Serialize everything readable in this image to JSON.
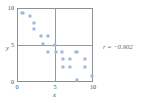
{
  "chart_data": {
    "type": "scatter",
    "title": "",
    "subtitle": "",
    "xlabel": "x",
    "ylabel": "y",
    "xlim": [
      0,
      10
    ],
    "ylim": [
      0,
      10
    ],
    "xticks": [
      0,
      5,
      10
    ],
    "yticks": [
      0,
      5,
      10
    ],
    "xtick_labels": [
      "0",
      "5",
      "10"
    ],
    "ytick_labels": [
      "0",
      "5",
      "10"
    ],
    "grid": true,
    "gridlines": {
      "vertical": [
        5
      ],
      "horizontal": [
        5
      ]
    },
    "legend": null,
    "annotations": [
      {
        "text": "r = −0.902",
        "x": 11.8,
        "y": 5.0,
        "meaning": "correlation-coefficient"
      }
    ],
    "marker": {
      "shape": "square",
      "color": "#9fb6dd",
      "size": 3
    },
    "points": [
      {
        "x": 0.6,
        "y": 9.5
      },
      {
        "x": 1.6,
        "y": 9.0
      },
      {
        "x": 2.2,
        "y": 8.1
      },
      {
        "x": 2.2,
        "y": 7.2
      },
      {
        "x": 3.1,
        "y": 6.2
      },
      {
        "x": 4.1,
        "y": 6.2
      },
      {
        "x": 3.4,
        "y": 5.1
      },
      {
        "x": 5.0,
        "y": 5.0
      },
      {
        "x": 4.1,
        "y": 4.0
      },
      {
        "x": 5.1,
        "y": 4.0
      },
      {
        "x": 6.0,
        "y": 4.0
      },
      {
        "x": 7.9,
        "y": 4.0
      },
      {
        "x": 6.1,
        "y": 3.0
      },
      {
        "x": 7.0,
        "y": 3.0
      },
      {
        "x": 9.0,
        "y": 3.0
      },
      {
        "x": 6.1,
        "y": 2.0
      },
      {
        "x": 7.0,
        "y": 2.0
      },
      {
        "x": 9.0,
        "y": 2.0
      },
      {
        "x": 8.0,
        "y": 0.1
      },
      {
        "x": 10.0,
        "y": 0.7
      }
    ]
  },
  "figure": {
    "annotation_text": "r = −0.902",
    "axis": {
      "x_label": "x",
      "y_label": "y",
      "x_tick_0": "0",
      "x_tick_1": "5",
      "x_tick_2": "10",
      "y_tick_0": "0",
      "y_tick_1": "5",
      "y_tick_2": "10"
    },
    "colors": {
      "marker": "#9fb6dd",
      "frame": "#8f8f93",
      "grid": "#9a9a9e",
      "text": "#4b4b4f",
      "background": "#ffffff"
    }
  }
}
